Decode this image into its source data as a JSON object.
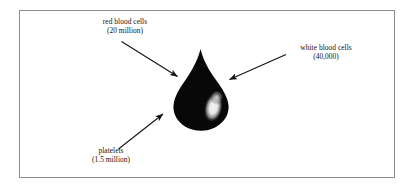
{
  "figure": {
    "kind": "blood-drop-composition-diagram",
    "background_color": "#ffffff",
    "frame_border_color": "#8d8d90",
    "drop_color": "#080808",
    "highlight_color": "#f2f2f2",
    "text_color": "#131313",
    "arrow_color": "#111111",
    "drop_label": "blood drop"
  },
  "callouts": [
    {
      "id": "red-blood-cells",
      "name": "red blood cells",
      "count_label": "(20 million)",
      "arrow_from": "upper-left",
      "arrow_to": "blood-drop"
    },
    {
      "id": "white-blood-cells",
      "name": "white blood cells",
      "count_label": "(40,000)",
      "arrow_from": "upper-right",
      "arrow_to": "blood-drop"
    },
    {
      "id": "platelets",
      "name": "platelets",
      "count_label": "(1.5 million)",
      "arrow_from": "lower-left",
      "arrow_to": "blood-drop"
    }
  ]
}
